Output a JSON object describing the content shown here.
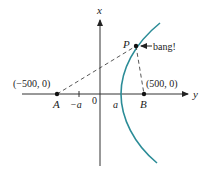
{
  "diagram": {
    "axes": {
      "vertical_label": "x",
      "horizontal_label": "y",
      "origin_label": "0"
    },
    "points": {
      "A": {
        "label": "A",
        "coord_label": "(−500, 0)"
      },
      "B": {
        "label": "B",
        "coord_label": "(500, 0)"
      },
      "P": {
        "label": "P",
        "annotation": "bang!"
      }
    },
    "ticks": {
      "neg_a": "−a",
      "pos_a": "a"
    },
    "colors": {
      "curve": "#2b8c97",
      "ink": "#222222"
    }
  }
}
